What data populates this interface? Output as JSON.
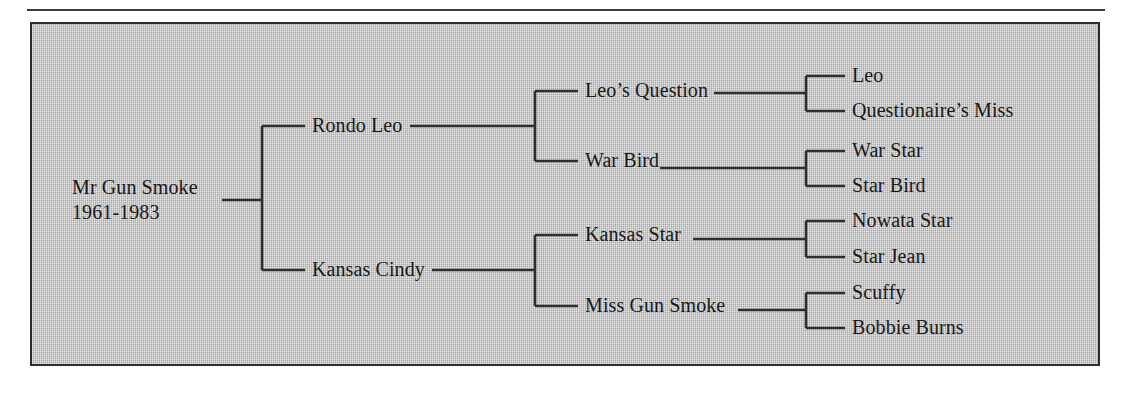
{
  "figure": {
    "type": "pedigree-chart",
    "background_color": "#b9b9b9",
    "line_color": "#2e2e2e",
    "text_color": "#191919"
  },
  "tree": {
    "root": {
      "name": "Mr Gun Smoke",
      "years": "1961-1983"
    },
    "generation2": [
      {
        "name": "Rondo Leo"
      },
      {
        "name": "Kansas Cindy"
      }
    ],
    "generation3": [
      {
        "name": "Leo’s Question"
      },
      {
        "name": "War Bird"
      },
      {
        "name": "Kansas Star"
      },
      {
        "name": "Miss Gun Smoke"
      }
    ],
    "generation4": [
      {
        "name": "Leo"
      },
      {
        "name": "Questionaire’s Miss"
      },
      {
        "name": "War Star"
      },
      {
        "name": "Star Bird"
      },
      {
        "name": "Nowata Star"
      },
      {
        "name": "Star Jean"
      },
      {
        "name": "Scuffy"
      },
      {
        "name": "Bobbie Burns"
      }
    ]
  }
}
